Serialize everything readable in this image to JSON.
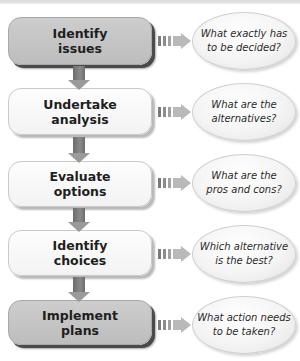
{
  "diagram": {
    "type": "decision-making process flowchart",
    "steps": [
      {
        "label": "Identify\nissues",
        "question": "What exactly has\nto be decided?",
        "style": "dark"
      },
      {
        "label": "Undertake\nanalysis",
        "question": "What are the\nalternatives?",
        "style": "light"
      },
      {
        "label": "Evaluate\noptions",
        "question": "What are the\npros and cons?",
        "style": "light"
      },
      {
        "label": "Identify\nchoices",
        "question": "Which alternative\nis the best?",
        "style": "light"
      },
      {
        "label": "Implement\nplans",
        "question": "What action needs\nto be taken?",
        "style": "dark"
      }
    ],
    "colors": {
      "dark_box": "#c6c6c6",
      "dark_shadow": "#4a4a4a",
      "light_box": "#f8f8f8",
      "arrow": "#8a8a8a",
      "bubble": "#f2f2f2"
    }
  }
}
